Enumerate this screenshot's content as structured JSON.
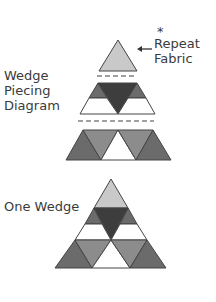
{
  "labels": {
    "asterisk": "*",
    "repeat_line1": "Repeat",
    "repeat_line2": "Fabric",
    "piecing_line1": "Wedge",
    "piecing_line2": "Piecing",
    "piecing_line3": "Diagram",
    "one_wedge": "One Wedge"
  },
  "colors": {
    "light": "#c9c9c9",
    "medium": "#8c8c8c",
    "mediumDark": "#6b6b6b",
    "dark": "#3d3d3d",
    "white": "#ffffff",
    "stroke": "#444444"
  }
}
